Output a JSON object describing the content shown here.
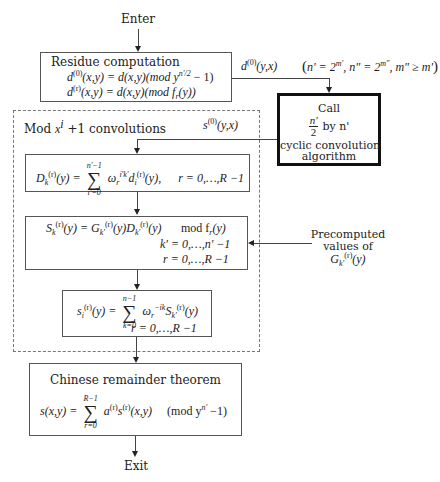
{
  "flow": {
    "enter_label": "Enter",
    "exit_label": "Exit"
  },
  "residue": {
    "title": "Residue computation",
    "eq1": "d(0)(x,y) = d(x,y)(mod y^(n'/2) − 1)",
    "eq1_parts": {
      "lhs": "d",
      "lhs_sup": "(0)",
      "args": "(x,y) = d(x,y)(mod y",
      "exp": "n'/2",
      "tail": " − 1)"
    },
    "eq2": "d(r)(x,y) = d(x,y)(mod f_r(y))",
    "eq2_parts": {
      "lhs": "d",
      "lhs_sup": "(r)",
      "args": "(x,y) = d(x,y)(mod f",
      "sub": "r",
      "tail": "(y))"
    },
    "output_label": "d(0)(y,x)",
    "output_parts": {
      "base": "d",
      "sup": "(0)",
      "args": "(y,x)"
    }
  },
  "condition": {
    "text": "(n' = 2^m', n\" = 2^m\", m\" ≥ m')",
    "parts": {
      "open": "(",
      "a": "n' = 2",
      "a_exp": "m'",
      "b": ", n\" = 2",
      "b_exp": "m\"",
      "c": ", m\" ≥ m'",
      "close": ")"
    }
  },
  "call_box": {
    "line1": "Call",
    "frac_num": "n'",
    "frac_den": "2",
    "by_text": "by n'",
    "line3": "cyclic convolution",
    "line4": "algorithm"
  },
  "convolutions": {
    "title": "Mod x^i + 1 convolutions",
    "title_parts": {
      "pre": "Mod ",
      "x": "x",
      "exp": "i",
      "post": " +1 convolutions"
    },
    "input_label": "s(0)(y,x)",
    "input_parts": {
      "base": "s",
      "sup": "(0)",
      "args": "(y,x)"
    }
  },
  "dft_box": {
    "equation": "D_k^(r)(y) = Σ_{i'=0}^{n'−1} ω_r^{i'k'} d_i^(r)(y),  r = 0,…,R−1",
    "lhs": "D",
    "lhs_sub": "k",
    "lhs_sup": "(r)",
    "lhs_arg": "(y) =",
    "sum_top": "n'−1",
    "sum_bot": "i'=0",
    "omega": "ω",
    "omega_sub": "r",
    "omega_sup": "i'k'",
    "d": "d",
    "d_sub": "i",
    "d_sup": "(r)",
    "d_arg": "(y),",
    "range": "r = 0,…,R −1"
  },
  "product_box": {
    "equation": "S_k^(r)(y) = G_k'^(r)(y) D_k'^(r)(y)  mod f_r(y)",
    "lhs": "S",
    "lhs_sub": "k",
    "lhs_sup": "(r)",
    "mid1": "(y) = ",
    "g": "G",
    "g_sub": "k'",
    "g_sup": "(r)",
    "mid2": "(y)",
    "dd": "D",
    "dd_sub": "k'",
    "dd_sup": "(r)",
    "mid3": "(y)",
    "mod": "mod f",
    "mod_sub": "r",
    "mod_tail": "(y)",
    "range1": "k' = 0,…,n' −1",
    "range2": "r = 0,…,R −1"
  },
  "inverse_box": {
    "equation": "s_i^(r)(y) = Σ_{k=0}^{n−1} ω_r^{−ik} S_k'^(r)(y)",
    "lhs": "s",
    "lhs_sub": "i",
    "lhs_sup": "(r)",
    "lhs_arg": "(y) =",
    "sum_top": "n−1",
    "sum_bot": "k=0",
    "omega": "ω",
    "omega_sub": "r",
    "omega_sup": "−ik",
    "S": "S",
    "S_sub": "k'",
    "S_sup": "(r)",
    "S_arg": "(y)",
    "range": "r = 0,…,R −1"
  },
  "precomputed": {
    "line1": "Precomputed",
    "line2": "values of",
    "g": "G",
    "g_sub": "k'",
    "g_sup": "(r)",
    "g_arg": "(y)"
  },
  "crt_box": {
    "title": "Chinese remainder theorem",
    "equation": "s(x,y) = Σ_{r=0}^{R−1} a^(r) s^(r)(x,y)  (mod y^{n'} − 1)",
    "lhs": "s(x,y) =",
    "sum_top": "R−1",
    "sum_bot": "r=0",
    "a": "a",
    "a_sup": "(r)",
    "s": "s",
    "s_sup": "(r)",
    "s_arg": "(x,y)",
    "mod": "(mod y",
    "mod_exp": "n'",
    "mod_tail": " −1)"
  },
  "colors": {
    "line": "#444444",
    "box_border": "#555555",
    "call_border": "#111111",
    "dashed_border": "#777777",
    "background": "#ffffff"
  }
}
